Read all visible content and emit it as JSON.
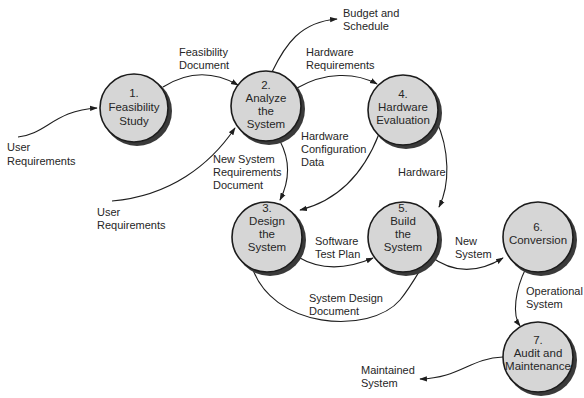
{
  "diagram": {
    "type": "data-flow",
    "nodes": [
      {
        "id": "1",
        "lines": [
          "1.",
          "Feasibility",
          "Study"
        ]
      },
      {
        "id": "2",
        "lines": [
          "2.",
          "Analyze",
          "the",
          "System"
        ]
      },
      {
        "id": "3",
        "lines": [
          "3.",
          "Design",
          "the",
          "System"
        ]
      },
      {
        "id": "4",
        "lines": [
          "4.",
          "Hardware",
          "Evaluation"
        ]
      },
      {
        "id": "5",
        "lines": [
          "5.",
          "Build",
          "the",
          "System"
        ]
      },
      {
        "id": "6",
        "lines": [
          "6.",
          "Conversion"
        ]
      },
      {
        "id": "7",
        "lines": [
          "7.",
          "Audit and",
          "Maintenance"
        ]
      }
    ],
    "flows": [
      {
        "from": "external",
        "to": "1",
        "lines": [
          "User",
          "Requirements"
        ]
      },
      {
        "from": "1",
        "to": "2",
        "lines": [
          "Feasibility",
          "Document"
        ]
      },
      {
        "from": "external",
        "to": "2",
        "lines": [
          "User",
          "Requirements"
        ]
      },
      {
        "from": "2",
        "to": "external",
        "lines": [
          "Budget and",
          "Schedule"
        ]
      },
      {
        "from": "2",
        "to": "4",
        "lines": [
          "Hardware",
          "Requirements"
        ]
      },
      {
        "from": "2",
        "to": "3",
        "lines": [
          "New System",
          "Requirements",
          "Document"
        ]
      },
      {
        "from": "4",
        "to": "3",
        "lines": [
          "Hardware",
          "Configuration",
          "Data"
        ]
      },
      {
        "from": "4",
        "to": "5",
        "lines": [
          "Hardware"
        ]
      },
      {
        "from": "3",
        "to": "5",
        "lines": [
          "Software",
          "Test Plan"
        ]
      },
      {
        "from": "3",
        "to": "5",
        "lines": [
          "System Design",
          "Document"
        ]
      },
      {
        "from": "5",
        "to": "6",
        "lines": [
          "New",
          "System"
        ]
      },
      {
        "from": "6",
        "to": "7",
        "lines": [
          "Operational",
          "System"
        ]
      },
      {
        "from": "7",
        "to": "external",
        "lines": [
          "Maintained",
          "System"
        ]
      }
    ]
  },
  "colors": {
    "node_fill": "#d6d6d6",
    "line": "#1e1e1e",
    "text": "#262626"
  }
}
